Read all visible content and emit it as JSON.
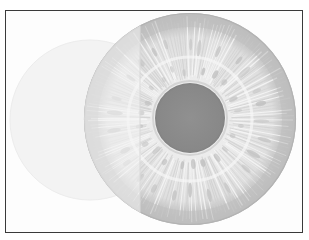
{
  "image": {
    "subject": "iris illustration",
    "style": "grayscale",
    "colors": {
      "background": "#fdfdfd",
      "border": "#3a3a3a",
      "ghost_circle": "#f3f3f3",
      "iris_base": "#e2e2e2",
      "limbal_ring": "#b9b9b9",
      "stripe": "#c8c8c8",
      "crypt": "#bdbdbd",
      "pupil": "#8c8c8c",
      "left_overlay": "#f0f0f0"
    },
    "geometry": {
      "frame": {
        "x": 5,
        "y": 10,
        "w": 298,
        "h": 223
      },
      "ghost_circle": {
        "cx": 90,
        "cy": 120,
        "r": 80
      },
      "iris": {
        "cx": 190,
        "cy": 119,
        "r": 106
      },
      "pupil": {
        "cx": 190,
        "cy": 118,
        "r": 35
      },
      "overlay_seam_x": 140
    }
  }
}
